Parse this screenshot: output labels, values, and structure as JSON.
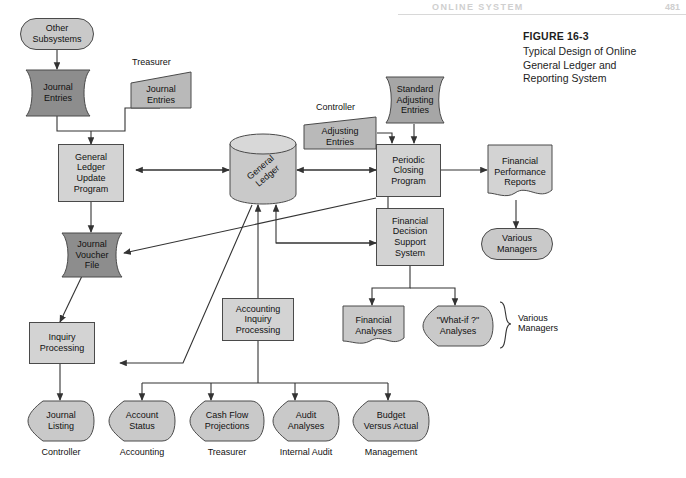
{
  "page": {
    "running_head": "ONLINE SYSTEM",
    "folio": "481"
  },
  "figure": {
    "number": "FIGURE 16-3",
    "title": "Typical Design of Online General Ledger and Reporting System",
    "title_lines": [
      "Typical Design of Online",
      "General Ledger and",
      "Reporting System"
    ]
  },
  "colors": {
    "process_fill": "#d3d3d3",
    "terminator_fill": "#c9c9c9",
    "dark_doc_fill": "#8d8d8d",
    "mid_doc_fill": "#a6a6a6",
    "input_fill": "#b9b9b9",
    "outline": "#4a4a4a",
    "wire": "#333333",
    "page_bg": "#ffffff"
  },
  "nodes": {
    "other_subsystems": {
      "label": "Other\nSubsystems",
      "lines": [
        "Other",
        "Subsystems"
      ],
      "shape": "terminator"
    },
    "journal_entries_sub": {
      "label": "Journal\nEntries",
      "lines": [
        "Journal",
        "Entries"
      ],
      "shape": "document-dark"
    },
    "journal_entries_treas": {
      "label": "Journal\nEntries",
      "lines": [
        "Journal",
        "Entries"
      ],
      "shape": "manual-input",
      "source": "Treasurer"
    },
    "gl_update_program": {
      "label": "General Ledger Update Program",
      "lines": [
        "General",
        "Ledger",
        "Update",
        "Program"
      ],
      "shape": "process"
    },
    "journal_voucher_file": {
      "label": "Journal Voucher File",
      "lines": [
        "Journal",
        "Voucher",
        "File"
      ],
      "shape": "magnetic-tape-dark"
    },
    "general_ledger": {
      "label": "General Ledger",
      "lines": [
        "General",
        "Ledger"
      ],
      "shape": "cylinder"
    },
    "adjusting_entries": {
      "label": "Adjusting Entries",
      "lines": [
        "Adjusting",
        "Entries"
      ],
      "shape": "manual-input",
      "source": "Controller"
    },
    "standard_adjusting": {
      "label": "Standard Adjusting Entries",
      "lines": [
        "Standard",
        "Adjusting",
        "Entries"
      ],
      "shape": "magnetic-tape-mid"
    },
    "periodic_closing": {
      "label": "Periodic Closing Program",
      "lines": [
        "Periodic",
        "Closing",
        "Program"
      ],
      "shape": "process"
    },
    "fin_perf_reports": {
      "label": "Financial Performance Reports",
      "lines": [
        "Financial",
        "Performance",
        "Reports"
      ],
      "shape": "document"
    },
    "various_managers_top": {
      "label": "Various Managers",
      "lines": [
        "Various",
        "Managers"
      ],
      "shape": "terminator"
    },
    "fdss": {
      "label": "Financial Decision Support System",
      "lines": [
        "Financial",
        "Decision",
        "Support",
        "System"
      ],
      "shape": "process"
    },
    "financial_analyses": {
      "label": "Financial Analyses",
      "lines": [
        "Financial",
        "Analyses"
      ],
      "shape": "document"
    },
    "what_if_analyses": {
      "label": "\"What-if ?\" Analyses",
      "lines": [
        "\"What-if ?\"",
        "Analyses"
      ],
      "shape": "display"
    },
    "accounting_inquiry": {
      "label": "Accounting Inquiry Processing",
      "lines": [
        "Accounting",
        "Inquiry",
        "Processing"
      ],
      "shape": "process"
    },
    "inquiry_processing": {
      "label": "Inquiry Processing",
      "lines": [
        "Inquiry",
        "Processing"
      ],
      "shape": "process"
    }
  },
  "source_labels": {
    "treasurer": "Treasurer",
    "controller": "Controller"
  },
  "bracket_label": {
    "lines": [
      "Various",
      "Managers"
    ],
    "text": "Various Managers"
  },
  "outputs": [
    {
      "lines": [
        "Journal",
        "Listing"
      ],
      "text": "Journal Listing",
      "recipient": "Controller"
    },
    {
      "lines": [
        "Account",
        "Status"
      ],
      "text": "Account Status",
      "recipient": "Accounting"
    },
    {
      "lines": [
        "Cash Flow",
        "Projections"
      ],
      "text": "Cash Flow Projections",
      "recipient": "Treasurer"
    },
    {
      "lines": [
        "Audit",
        "Analyses"
      ],
      "text": "Audit Analyses",
      "recipient": "Internal Audit"
    },
    {
      "lines": [
        "Budget",
        "Versus Actual"
      ],
      "text": "Budget Versus Actual",
      "recipient": "Management"
    }
  ]
}
